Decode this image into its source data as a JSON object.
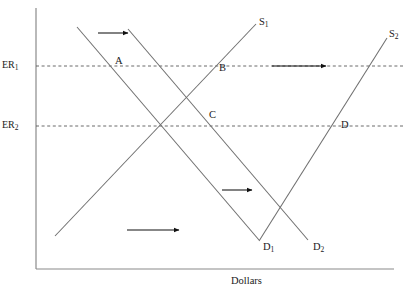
{
  "figure": {
    "type": "economics-supply-demand-diagram",
    "title": "",
    "background_color": "#ffffff",
    "line_color": "#6f6f6f",
    "axis_color": "#8a8a8a",
    "arrow_color": "#111111",
    "text_color": "#1a1a1a"
  },
  "axes": {
    "x_axis": {
      "label": "Dollars",
      "label_x": 231,
      "label_y": 276,
      "y": 269,
      "x_start": 36,
      "x_end": 394
    },
    "y_axis": {
      "label": "",
      "x": 36,
      "y_start": 8,
      "y_end": 269
    }
  },
  "tick_labels": [
    {
      "id": "er1",
      "text_main": "ER",
      "text_sub": "1",
      "x": 2,
      "y": 60,
      "level_y": 66
    },
    {
      "id": "er2",
      "text_main": "ER",
      "text_sub": "2",
      "x": 2,
      "y": 120,
      "level_y": 126
    }
  ],
  "reference_lines": [
    {
      "id": "er1-dashed",
      "name": "ER1 exchange rate level",
      "x1": 36,
      "y1": 66,
      "x2": 404,
      "y2": 66
    },
    {
      "id": "er2-dashed",
      "name": "ER2 exchange rate level",
      "x1": 36,
      "y1": 126,
      "x2": 404,
      "y2": 126
    }
  ],
  "curves": [
    {
      "id": "s1",
      "name": "supply-curve-1",
      "label_main": "S",
      "label_sub": "1",
      "label_x": 259,
      "label_y": 17,
      "slope": "upward",
      "x1": 55,
      "y1": 236,
      "x2": 256,
      "y2": 24
    },
    {
      "id": "s2",
      "name": "supply-curve-2",
      "label_main": "S",
      "label_sub": "2",
      "label_x": 389,
      "label_y": 29,
      "slope": "upward",
      "x1": 259,
      "y1": 241,
      "x2": 387,
      "y2": 38
    },
    {
      "id": "d1",
      "name": "demand-curve-1",
      "label_main": "D",
      "label_sub": "1",
      "label_x": 263,
      "label_y": 242,
      "slope": "downward",
      "x1": 77,
      "y1": 27,
      "x2": 259,
      "y2": 240
    },
    {
      "id": "d2",
      "name": "demand-curve-2",
      "label_main": "D",
      "label_sub": "2",
      "label_x": 313,
      "label_y": 242,
      "slope": "downward",
      "x1": 128,
      "y1": 29,
      "x2": 308,
      "y2": 240
    }
  ],
  "points": [
    {
      "id": "a",
      "label": "A",
      "x": 115,
      "y": 56,
      "description": "intersection of D1 and ER1"
    },
    {
      "id": "b",
      "label": "B",
      "x": 219,
      "y": 63,
      "description": "intersection of S1 and ER1"
    },
    {
      "id": "c",
      "label": "C",
      "x": 209,
      "y": 110,
      "description": "intersection of D2 and ER2"
    },
    {
      "id": "d",
      "label": "D",
      "x": 341,
      "y": 120,
      "description": "intersection of S2 and ER2"
    }
  ],
  "arrows": [
    {
      "id": "arrow-demand-shift-top",
      "name": "demand shift arrow top",
      "x1": 98,
      "y1": 33,
      "x2": 128,
      "y2": 33,
      "direction": "right"
    },
    {
      "id": "arrow-supply-shift",
      "name": "supply shift arrow",
      "x1": 272,
      "y1": 66,
      "x2": 326,
      "y2": 66,
      "direction": "right"
    },
    {
      "id": "arrow-demand-shift-mid",
      "name": "demand shift arrow middle",
      "x1": 222,
      "y1": 190,
      "x2": 252,
      "y2": 190,
      "direction": "right"
    },
    {
      "id": "arrow-supply-shift-bottom",
      "name": "supply shift arrow bottom",
      "x1": 127,
      "y1": 230,
      "x2": 179,
      "y2": 230,
      "direction": "right"
    }
  ],
  "chart_data": {
    "type": "line",
    "title": "",
    "xlabel": "Dollars",
    "ylabel": "",
    "grid": false,
    "legend": "none",
    "x_tick_labels": [],
    "y_tick_labels": [
      "ER1",
      "ER2"
    ],
    "annotations": [
      "A",
      "B",
      "C",
      "D"
    ],
    "series": [
      {
        "name": "S1",
        "slope": "upward",
        "points": [
          [
            55,
            236
          ],
          [
            256,
            24
          ]
        ]
      },
      {
        "name": "S2",
        "slope": "upward",
        "points": [
          [
            259,
            241
          ],
          [
            387,
            38
          ]
        ]
      },
      {
        "name": "D1",
        "slope": "downward",
        "points": [
          [
            77,
            27
          ],
          [
            259,
            240
          ]
        ]
      },
      {
        "name": "D2",
        "slope": "downward",
        "points": [
          [
            128,
            29
          ],
          [
            308,
            240
          ]
        ]
      }
    ]
  }
}
